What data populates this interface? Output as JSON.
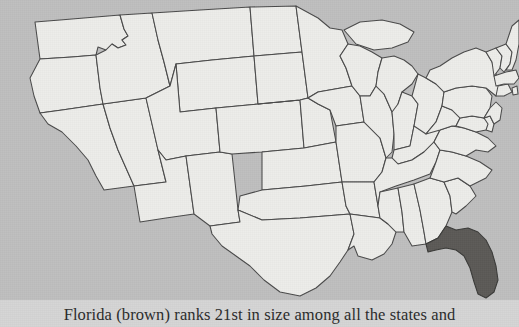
{
  "page": {
    "background_color": "#d5d5d5"
  },
  "figure": {
    "name": "united-states-map",
    "ocean_color": "#bfbfbf",
    "state_fill_color": "#ededea",
    "state_border_color": "#4a4a4a",
    "highlight": {
      "state": "Florida",
      "color": "#5c5a57",
      "legend_word": "brown"
    }
  },
  "caption": {
    "text": "Florida (brown) ranks 21st in size among all the states and",
    "color": "#2b2b2b"
  },
  "states": [
    {
      "code": "WA",
      "name": "Washington"
    },
    {
      "code": "OR",
      "name": "Oregon"
    },
    {
      "code": "CA",
      "name": "California"
    },
    {
      "code": "NV",
      "name": "Nevada"
    },
    {
      "code": "ID",
      "name": "Idaho"
    },
    {
      "code": "MT",
      "name": "Montana"
    },
    {
      "code": "WY",
      "name": "Wyoming"
    },
    {
      "code": "UT",
      "name": "Utah"
    },
    {
      "code": "AZ",
      "name": "Arizona"
    },
    {
      "code": "NM",
      "name": "New Mexico"
    },
    {
      "code": "CO",
      "name": "Colorado"
    },
    {
      "code": "ND",
      "name": "North Dakota"
    },
    {
      "code": "SD",
      "name": "South Dakota"
    },
    {
      "code": "NE",
      "name": "Nebraska"
    },
    {
      "code": "KS",
      "name": "Kansas"
    },
    {
      "code": "OK",
      "name": "Oklahoma"
    },
    {
      "code": "TX",
      "name": "Texas"
    },
    {
      "code": "MN",
      "name": "Minnesota"
    },
    {
      "code": "IA",
      "name": "Iowa"
    },
    {
      "code": "MO",
      "name": "Missouri"
    },
    {
      "code": "AR",
      "name": "Arkansas"
    },
    {
      "code": "LA",
      "name": "Louisiana"
    },
    {
      "code": "WI",
      "name": "Wisconsin"
    },
    {
      "code": "IL",
      "name": "Illinois"
    },
    {
      "code": "MI",
      "name": "Michigan"
    },
    {
      "code": "IN",
      "name": "Indiana"
    },
    {
      "code": "OH",
      "name": "Ohio"
    },
    {
      "code": "KY",
      "name": "Kentucky"
    },
    {
      "code": "TN",
      "name": "Tennessee"
    },
    {
      "code": "MS",
      "name": "Mississippi"
    },
    {
      "code": "AL",
      "name": "Alabama"
    },
    {
      "code": "GA",
      "name": "Georgia"
    },
    {
      "code": "FL",
      "name": "Florida"
    },
    {
      "code": "SC",
      "name": "South Carolina"
    },
    {
      "code": "NC",
      "name": "North Carolina"
    },
    {
      "code": "VA",
      "name": "Virginia"
    },
    {
      "code": "WV",
      "name": "West Virginia"
    },
    {
      "code": "MD",
      "name": "Maryland"
    },
    {
      "code": "DE",
      "name": "Delaware"
    },
    {
      "code": "PA",
      "name": "Pennsylvania"
    },
    {
      "code": "NJ",
      "name": "New Jersey"
    },
    {
      "code": "NY",
      "name": "New York"
    },
    {
      "code": "CT",
      "name": "Connecticut"
    },
    {
      "code": "RI",
      "name": "Rhode Island"
    },
    {
      "code": "MA",
      "name": "Massachusetts"
    },
    {
      "code": "VT",
      "name": "Vermont"
    },
    {
      "code": "NH",
      "name": "New Hampshire"
    },
    {
      "code": "ME",
      "name": "Maine"
    }
  ]
}
